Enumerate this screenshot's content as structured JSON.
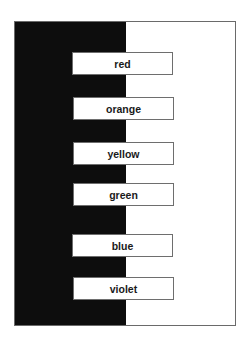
{
  "diagram": {
    "background_colors": {
      "left_panel": "#0d0d0d",
      "right_panel": "#ffffff",
      "frame_border": "#6a6a6a"
    },
    "labels": [
      {
        "text": "red",
        "top": 52,
        "left": 72
      },
      {
        "text": "orange",
        "top": 97,
        "left": 73
      },
      {
        "text": "yellow",
        "top": 142,
        "left": 73
      },
      {
        "text": "green",
        "top": 183,
        "left": 73
      },
      {
        "text": "blue",
        "top": 234,
        "left": 72
      },
      {
        "text": "violet",
        "top": 277,
        "left": 73
      }
    ]
  }
}
